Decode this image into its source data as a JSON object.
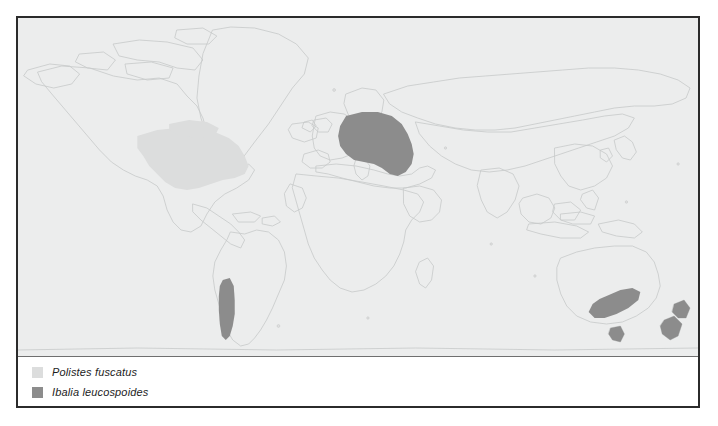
{
  "figure": {
    "type": "distribution-map",
    "projection": "world-equirectangular",
    "background_color": "#eceded",
    "border_color": "#2b2b2b",
    "coastline_color": "#c9cbcb",
    "panel_divider_color": "#6f6f6f",
    "legend_background": "#ffffff"
  },
  "legend": {
    "items": [
      {
        "label": "Polistes fuscatus",
        "color": "#dcdddd",
        "swatch_name": "legend-swatch-polistes-fuscatus"
      },
      {
        "label": "Ibalia leucospoides",
        "color": "#8c8c8c",
        "swatch_name": "legend-swatch-ibalia-leucospoides"
      }
    ]
  },
  "distribution_regions": [
    {
      "species": "Polistes fuscatus",
      "color": "#dcdddd",
      "regions": [
        "Eastern North America",
        "Southeastern Canada",
        "Eastern United States"
      ]
    },
    {
      "species": "Ibalia leucospoides",
      "color": "#8c8c8c",
      "regions": [
        "Central Europe",
        "Central Chile",
        "Southeastern Australia",
        "Tasmania",
        "New Zealand North Island",
        "New Zealand South Island"
      ]
    }
  ]
}
